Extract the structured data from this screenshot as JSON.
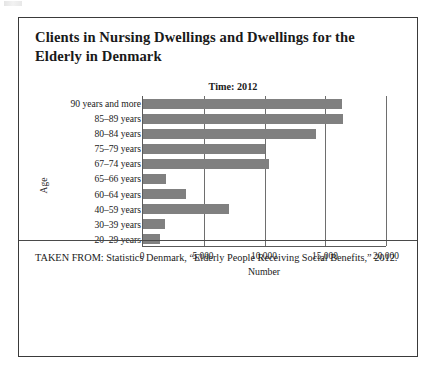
{
  "figure": {
    "title": "Clients in Nursing Dwellings and Dwellings for the Elderly in Denmark",
    "subtitle": "Time: 2012",
    "source": "TAKEN FROM: Statistics Denmark, “Elderly People Receiving Social Benefits,” 2012."
  },
  "colors": {
    "bar_fill": "#808080",
    "border": "#3a3a3a",
    "axis": "#5a5a5a",
    "grid": "#6e6e6e"
  },
  "chart_data": {
    "type": "bar",
    "orientation": "horizontal",
    "title": "Clients in Nursing Dwellings and Dwellings for the Elderly in Denmark",
    "subtitle": "Time: 2012",
    "xlabel": "Number",
    "ylabel": "Age",
    "categories": [
      "90 years and more",
      "85–89 years",
      "80–84 years",
      "75–79 years",
      "67–74 years",
      "65–66 years",
      "60–64 years",
      "40–59 years",
      "30–39 years",
      "20–29 years"
    ],
    "values": [
      16400,
      16500,
      14200,
      10000,
      10400,
      1900,
      3500,
      7100,
      1800,
      1400
    ],
    "xlim": [
      0,
      20000
    ],
    "xticks": [
      0,
      5000,
      10000,
      15000,
      20000
    ],
    "xticklabels": [
      "0",
      "5,000",
      "10,000",
      "15,000",
      "20,000"
    ],
    "grid": "vertical",
    "legend": "none"
  }
}
